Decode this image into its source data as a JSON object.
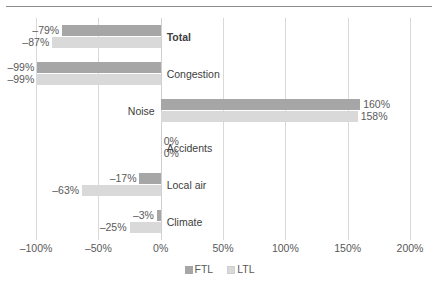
{
  "chart_data": {
    "type": "bar",
    "orientation": "horizontal",
    "title": "",
    "xlabel": "",
    "ylabel": "",
    "xlim": [
      -100,
      200
    ],
    "grid": true,
    "legend_position": "bottom",
    "categories": [
      "Total",
      "Congestion",
      "Noise",
      "Accidents",
      "Local air",
      "Climate"
    ],
    "tick_labels": [
      "–100%",
      "–50%",
      "0%",
      "50%",
      "100%",
      "150%",
      "200%"
    ],
    "tick_values": [
      -100,
      -50,
      0,
      50,
      100,
      150,
      200
    ],
    "series": [
      {
        "name": "FTL",
        "color": "#a6a6a6",
        "values": [
          -79,
          -99,
          160,
          0,
          -17,
          -3
        ],
        "labels": [
          "–79%",
          "–99%",
          "160%",
          "0%",
          "–17%",
          "–3%"
        ]
      },
      {
        "name": "LTL",
        "color": "#d9d9d9",
        "values": [
          -87,
          -99,
          158,
          0,
          -63,
          -25
        ],
        "labels": [
          "–87%",
          "–99%",
          "158%",
          "0%",
          "–63%",
          "–25%"
        ]
      }
    ]
  },
  "legend": {
    "items": [
      {
        "label": "FTL",
        "swatch": "ftl"
      },
      {
        "label": "LTL",
        "swatch": "ltl"
      }
    ]
  }
}
